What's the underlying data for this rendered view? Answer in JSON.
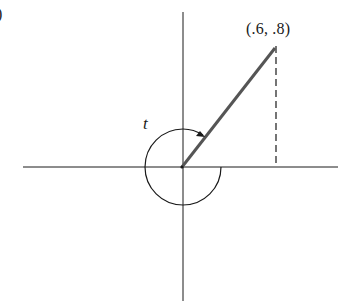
{
  "diagram": {
    "type": "unit-circle-angle",
    "corner_glyph": ")",
    "point": {
      "label": "(.6, .8)",
      "x": 0.6,
      "y": 0.8
    },
    "angle": {
      "label": "t",
      "description": "angle greater than one full revolution, ending at terminal ray through (.6, .8)"
    },
    "elements": [
      "x-axis",
      "y-axis",
      "terminal-ray",
      "dashed-vertical-projection",
      "angle-arc-with-arrow"
    ],
    "colors": {
      "ink": "#1a1a1a",
      "ray": "#555555",
      "background": "#ffffff"
    }
  }
}
